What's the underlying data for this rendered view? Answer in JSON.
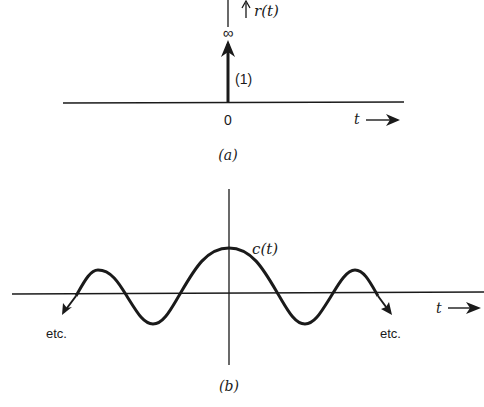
{
  "figure_a": {
    "signal_label": "r(t)",
    "infinity_label": "∞",
    "impulse_weight_label": "(1)",
    "origin_label": "0",
    "time_axis_label": "t",
    "caption": "(a)"
  },
  "figure_b": {
    "signal_label": "c(t)",
    "time_axis_label": "t",
    "left_continuation_label": "etc.",
    "right_continuation_label": "etc.",
    "caption": "(b)"
  },
  "colors": {
    "ink": "#1a1a1a",
    "background": "#ffffff"
  }
}
